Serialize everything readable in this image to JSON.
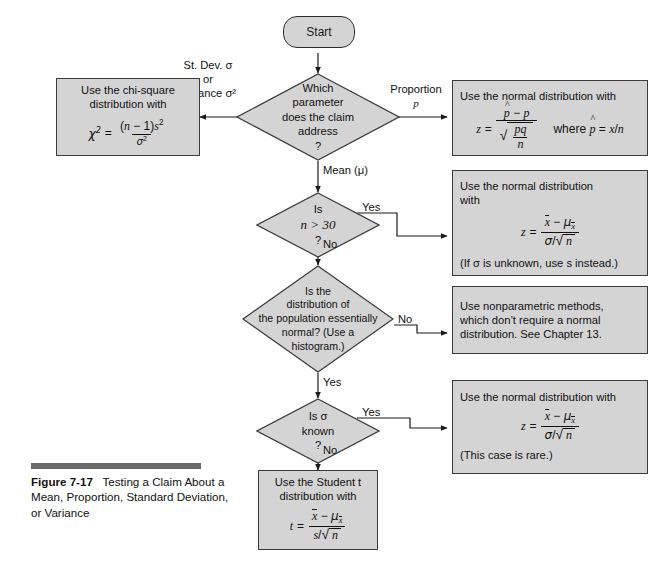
{
  "figure": {
    "number": "Figure 7-17",
    "caption": "Testing a Claim About a Mean, Proportion, Standard Deviation, or Variance",
    "bar_color": "#6b6b6b"
  },
  "theme": {
    "node_fill": "#d4d4d4",
    "node_stroke": "#3a3a3a",
    "text_color": "#111111",
    "page_background": "#ffffff"
  },
  "nodes": {
    "start": {
      "label": "Start",
      "shape": "rounded"
    },
    "d_parameter": {
      "shape": "diamond",
      "lines": [
        "Which",
        "parameter",
        "does the claim",
        "address",
        "?"
      ]
    },
    "d_n30": {
      "shape": "diamond",
      "lines": [
        "Is",
        "n > 30",
        "?"
      ]
    },
    "d_normal": {
      "shape": "diamond",
      "lines": [
        "Is the",
        "distribution of",
        "the population essentially",
        "normal? (Use a",
        "histogram.)"
      ]
    },
    "d_sigma": {
      "shape": "diamond",
      "lines": [
        "Is σ",
        "known",
        "?"
      ]
    },
    "b_chisq": {
      "shape": "box",
      "lines": [
        "Use the chi-square",
        "distribution with"
      ],
      "formula": "χ² = (n − 1)s² / σ²"
    },
    "b_prop": {
      "shape": "box",
      "lines": [
        "Use the normal distribution with"
      ],
      "formula": "z = (p̂ − p) / √(pq/n)",
      "note": "where p̂ = x/n"
    },
    "b_n30": {
      "shape": "box",
      "lines": [
        "Use the normal distribution",
        "with"
      ],
      "formula": "z = (x̄ − μₓ̄) / (σ/√n)",
      "note": "(If σ is unknown, use s instead.)"
    },
    "b_nonparam": {
      "shape": "box",
      "lines": [
        "Use nonparametric methods,",
        "which don’t require a normal",
        "distribution. See Chapter 13."
      ]
    },
    "b_sigma_known": {
      "shape": "box",
      "lines": [
        "Use the normal distribution with"
      ],
      "formula": "z = (x̄ − μₓ̄) / (σ/√n)",
      "note": "(This case is rare.)"
    },
    "b_student_t": {
      "shape": "box",
      "lines": [
        "Use the Student t",
        "distribution with"
      ],
      "formula": "t = (x̄ − μₓ̄) / (s/√n)"
    }
  },
  "edge_labels": {
    "stdev": [
      "St. Dev. σ",
      "or",
      "variance σ²"
    ],
    "proportion": [
      "Proportion",
      "p"
    ],
    "mean": "Mean (μ)",
    "n30_yes": "Yes",
    "n30_no": "No",
    "normal_no": "No",
    "normal_yes": "Yes",
    "sigma_yes": "Yes",
    "sigma_no": "No"
  }
}
